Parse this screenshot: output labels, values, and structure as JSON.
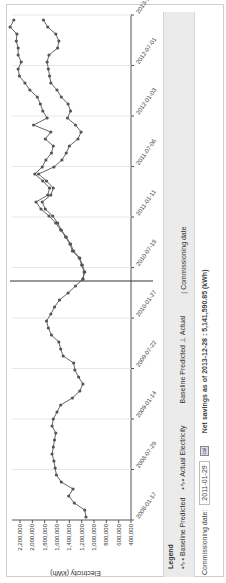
{
  "chart_data": {
    "type": "line",
    "title": "",
    "xlabel": "",
    "ylabel": "Electricity (kWh)",
    "ylim": [
      400000,
      2200000
    ],
    "yticks": [
      2200000,
      2000000,
      1800000,
      1600000,
      1400000,
      1200000,
      1000000,
      800000,
      600000,
      400000
    ],
    "ytick_labels": [
      "2,200,000",
      "2,000,000",
      "1,800,000",
      "1,600,000",
      "1,400,000",
      "1,200,000",
      "1,000,000",
      "800,000",
      "600,000",
      "400,000"
    ],
    "xtick_labels": [
      "2008-01-17",
      "2008-07-29",
      "2009-01-14",
      "2009-07-22",
      "2010-01-27",
      "2010-07-18",
      "2011-01-11",
      "2011-07-06",
      "2012-01-03",
      "2012-07-01",
      "2013-12-28"
    ],
    "grid": "vertical",
    "commissioning_date": "2011-01-29",
    "series": [
      {
        "name": "Actual Electricity",
        "values": [
          1130000,
          1150000,
          1320000,
          1410000,
          1340000,
          1530000,
          1610000,
          1630000,
          1650000,
          1680000,
          1660000,
          1640000,
          1620000,
          1680000,
          1660000,
          1600000,
          1540000,
          1350000,
          1230000,
          1180000,
          1250000,
          1310000,
          1330000,
          1500000,
          1540000,
          1570000,
          1690000,
          1740000,
          1770000,
          1700000,
          1640000,
          1560000,
          1420000,
          1300000,
          1180000,
          1150000,
          1190000,
          1230000,
          1330000,
          1380000,
          1450000,
          1530000,
          1590000,
          1670000,
          1790000,
          1840000,
          1700000,
          1660000,
          1770000,
          1900000,
          1650000,
          1520000,
          1450000,
          1400000,
          1260000,
          1210000,
          1300000,
          1430000,
          1380000,
          1420000,
          1530000,
          1600000,
          1700000,
          1720000,
          1740000,
          1760000,
          1730000,
          1590000,
          1570000,
          1620000,
          1750000,
          1820000
        ]
      },
      {
        "name": "Baseline Predicted",
        "values": [
          null,
          null,
          null,
          null,
          null,
          null,
          null,
          null,
          null,
          null,
          null,
          null,
          null,
          null,
          null,
          null,
          null,
          null,
          null,
          null,
          null,
          null,
          null,
          null,
          null,
          null,
          null,
          null,
          null,
          null,
          null,
          null,
          null,
          null,
          1180000,
          1160000,
          1200000,
          1240000,
          1350000,
          1390000,
          1460000,
          1540000,
          1620000,
          1730000,
          1860000,
          1940000,
          1750000,
          1720000,
          1830000,
          1960000,
          1840000,
          1780000,
          1690000,
          1660000,
          1790000,
          1700000,
          1980000,
          1760000,
          1830000,
          1870000,
          1920000,
          2040000,
          2120000,
          2210000,
          2230000,
          2180000,
          2230000,
          2230000,
          2260000,
          2250000,
          2360000,
          2300000
        ]
      }
    ]
  },
  "legend": {
    "title": "Legend",
    "items": [
      {
        "symbol": "•∿•",
        "label": "Baseline Predicted"
      },
      {
        "symbol": "•∿•",
        "label": "Actual Electricity"
      },
      {
        "symbol": "",
        "label": "Baseline Predicted"
      },
      {
        "symbol": "⊥",
        "label": "Actual"
      },
      {
        "symbol": "|",
        "label": "Commissioning date"
      }
    ]
  },
  "footer": {
    "commissioning_label": "Commissioning date:",
    "commissioning_value": "2011-01-29",
    "calendar_icon": "cal",
    "savings_text": "Net savings as of 2013-12-28 : 5,141,590.85 (kWh)"
  }
}
